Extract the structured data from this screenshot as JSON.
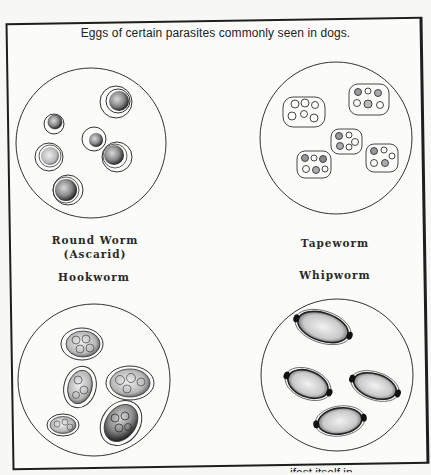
{
  "figure": {
    "caption": "Eggs of certain parasites commonly seen in dogs.",
    "panels": [
      {
        "id": "round-worm",
        "label_line1": "Round Worm",
        "label_line2": "(Ascarid)",
        "egg_count": 6
      },
      {
        "id": "tapeworm",
        "label_line1": "Tapeworm",
        "egg_count": 5
      },
      {
        "id": "hookworm",
        "label_line1": "Hookworm",
        "egg_count": 5
      },
      {
        "id": "whipworm",
        "label_line1": "Whipworm",
        "egg_count": 4
      }
    ]
  },
  "footer": {
    "cut_off_text": "ifest itself in"
  },
  "colors": {
    "ink": "#1e1e1e",
    "paper": "#fbfbf9"
  }
}
